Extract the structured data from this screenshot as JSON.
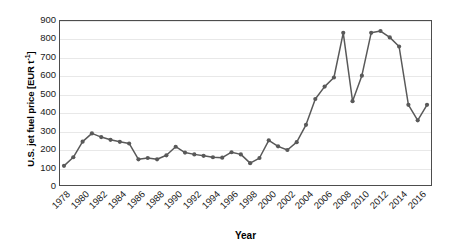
{
  "chart_data": {
    "type": "line",
    "title": "",
    "xlabel": "Year",
    "ylabel": "U.S. jet fuel price [EUR t-1]",
    "ylabel_prefix": "U.S. jet fuel price [EUR t",
    "ylabel_exponent": "-1",
    "ylabel_suffix": "]",
    "xlim": [
      1978,
      2017
    ],
    "ylim": [
      0,
      900
    ],
    "ytick_labels": [
      "900",
      "800",
      "700",
      "600",
      "500",
      "400",
      "300",
      "200",
      "100",
      "0"
    ],
    "ytick_values": [
      900,
      800,
      700,
      600,
      500,
      400,
      300,
      200,
      100,
      0
    ],
    "xtick_labels": [
      "1978",
      "1980",
      "1982",
      "1984",
      "1986",
      "1988",
      "1990",
      "1992",
      "1994",
      "1996",
      "1998",
      "2000",
      "2002",
      "2004",
      "2006",
      "2008",
      "2010",
      "2012",
      "2014",
      "2016"
    ],
    "xtick_values": [
      1978,
      1980,
      1982,
      1984,
      1986,
      1988,
      1990,
      1992,
      1994,
      1996,
      1998,
      2000,
      2002,
      2004,
      2006,
      2008,
      2010,
      2012,
      2014,
      2016
    ],
    "xtick_rotation": -45,
    "grid": "horizontal",
    "legend": "none",
    "series_color": "#595959",
    "marker": "circle",
    "x": [
      1978,
      1979,
      1980,
      1981,
      1982,
      1983,
      1984,
      1985,
      1986,
      1987,
      1988,
      1989,
      1990,
      1991,
      1992,
      1993,
      1994,
      1995,
      1996,
      1997,
      1998,
      1999,
      2000,
      2001,
      2002,
      2003,
      2004,
      2005,
      2006,
      2007,
      2008,
      2009,
      2010,
      2011,
      2012,
      2013,
      2014,
      2015,
      2016,
      2017
    ],
    "values": [
      105,
      152,
      238,
      283,
      263,
      248,
      237,
      228,
      141,
      148,
      141,
      163,
      210,
      178,
      168,
      160,
      152,
      150,
      180,
      168,
      120,
      148,
      245,
      212,
      192,
      235,
      330,
      472,
      540,
      590,
      835,
      460,
      600,
      835,
      845,
      810,
      760,
      440,
      355,
      440
    ],
    "annotations": []
  }
}
